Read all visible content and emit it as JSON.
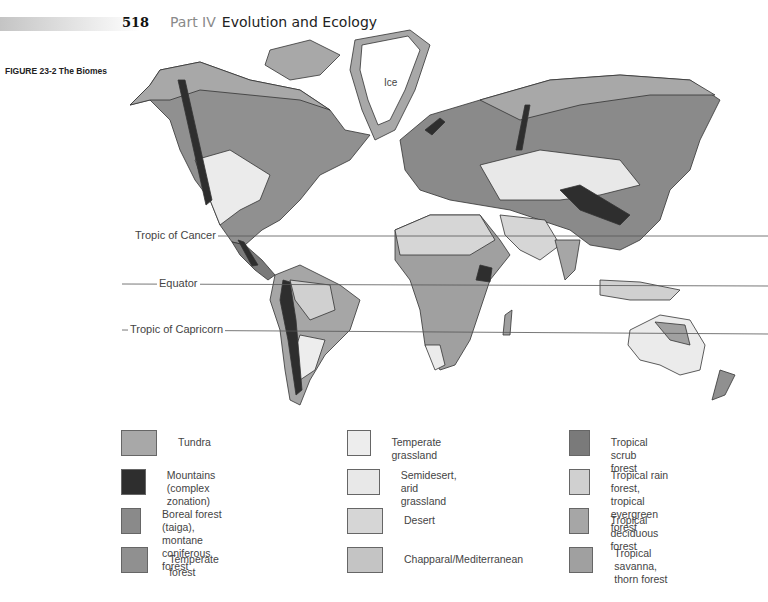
{
  "header": {
    "page_number": "518",
    "part": "Part IV",
    "part_title": "Evolution and Ecology"
  },
  "figure": {
    "label": "FIGURE 23-2  The Biomes"
  },
  "map": {
    "ice_label": "Ice",
    "latitude_lines": [
      {
        "label": "Tropic of Cancer"
      },
      {
        "label": "Equator"
      },
      {
        "label": "Tropic of Capricorn"
      }
    ]
  },
  "legend": {
    "items": [
      {
        "label": "Tundra",
        "color": "#a8a8a8"
      },
      {
        "label": "Mountains\n(complex zonation)",
        "color": "#2e2e2e"
      },
      {
        "label": "Boreal forest (taiga),\nmontane coniferous forest",
        "color": "#8a8a8a"
      },
      {
        "label": "Temperate forest",
        "color": "#909090"
      },
      {
        "label": "Temperate grassland",
        "color": "#ededed"
      },
      {
        "label": "Semidesert,\narid grassland",
        "color": "#e8e8e8"
      },
      {
        "label": "Desert",
        "color": "#d6d6d6"
      },
      {
        "label": "Chapparal/Mediterranean",
        "color": "#c4c4c4"
      },
      {
        "label": "Tropical scrub forest",
        "color": "#7a7a7a"
      },
      {
        "label": "Tropical rain forest,\ntropical evergreen forest",
        "color": "#d0d0d0"
      },
      {
        "label": "Tropical deciduous forest",
        "color": "#a6a6a6"
      },
      {
        "label": "Tropical savanna,\nthorn forest",
        "color": "#a0a0a0"
      }
    ]
  }
}
